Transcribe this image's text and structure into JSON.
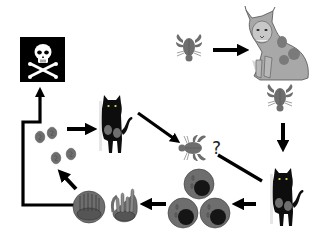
{
  "diagram": {
    "type": "parasite-life-cycle",
    "nodes": [
      {
        "id": "death",
        "icon": "skull-crossbones-icon",
        "label": ""
      },
      {
        "id": "crayfish-top",
        "icon": "crayfish-icon",
        "label": ""
      },
      {
        "id": "lynx",
        "icon": "lynx-icon",
        "label": ""
      },
      {
        "id": "crayfish-right",
        "icon": "crayfish-icon",
        "label": ""
      },
      {
        "id": "cat-right",
        "icon": "black-cat-icon",
        "label": ""
      },
      {
        "id": "cells",
        "icon": "infected-cells-icon",
        "label": ""
      },
      {
        "id": "sporocysts",
        "icon": "sporocyst-icon",
        "label": ""
      },
      {
        "id": "oocysts",
        "icon": "oocysts-icon",
        "label": ""
      },
      {
        "id": "cat-center",
        "icon": "black-cat-icon",
        "label": ""
      },
      {
        "id": "crayfish-center",
        "icon": "crayfish-icon",
        "label": ""
      }
    ],
    "edges": [
      {
        "from": "crayfish-top",
        "to": "lynx"
      },
      {
        "from": "crayfish-right",
        "to": "cat-right"
      },
      {
        "from": "cat-right",
        "to": "cells"
      },
      {
        "from": "cells",
        "to": "sporocysts"
      },
      {
        "from": "sporocysts",
        "to": "oocysts"
      },
      {
        "from": "oocysts",
        "to": "cat-center"
      },
      {
        "from": "cat-center",
        "to": "crayfish-center"
      },
      {
        "from": "crayfish-center",
        "to": "cat-right"
      },
      {
        "from": "sporocysts",
        "to": "death"
      }
    ],
    "uncertain_mark": "?",
    "colors": {
      "arrow": "#000000",
      "parasite_gray": "#6e6e6e",
      "nucleus": "#1a1a1a",
      "skull_bg": "#000000",
      "skull_fg": "#ffffff"
    }
  }
}
